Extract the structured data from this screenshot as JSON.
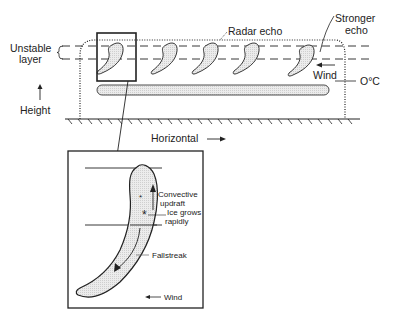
{
  "diagram": {
    "labels": {
      "unstable_layer_1": "Unstable",
      "unstable_layer_2": "layer",
      "height": "Height",
      "horizontal": "Horizontal",
      "radar_echo": "Radar echo",
      "stronger_echo_1": "Stronger",
      "stronger_echo_2": "echo",
      "wind_main": "Wind",
      "zero_c": "O°C"
    },
    "inset": {
      "convective_1": "Convective",
      "convective_2": "updraft",
      "ice_1": "Ice grows",
      "ice_2": "rapidly",
      "fallstreak": "Fallstreak",
      "wind": "Wind"
    },
    "colors": {
      "line": "#222222",
      "fill": "#e6e6e6"
    }
  }
}
